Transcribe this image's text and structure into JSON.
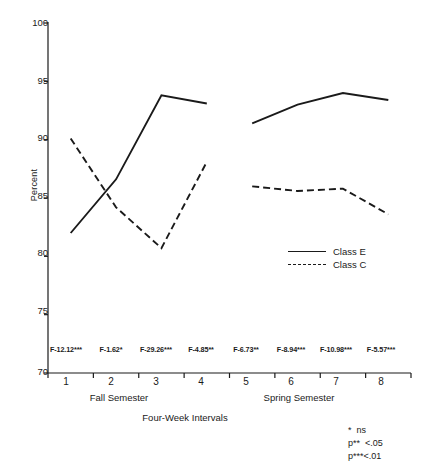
{
  "chart_data": {
    "type": "line",
    "title": "",
    "xlabel": "Four-Week Intervals",
    "ylabel": "Percent",
    "ylim": [
      70,
      100
    ],
    "ytick_labels": [
      "70",
      "75",
      "80",
      "85",
      "90",
      "95",
      "100"
    ],
    "yticks": [
      70,
      75,
      80,
      85,
      90,
      95,
      100
    ],
    "categories": [
      "1",
      "2",
      "3",
      "4",
      "5",
      "6",
      "7",
      "8"
    ],
    "x": [
      1,
      2,
      3,
      4,
      5,
      6,
      7,
      8
    ],
    "grid": false,
    "legend_position": "center-right",
    "series": [
      {
        "name": "Class E",
        "style": "solid",
        "values": [
          82.0,
          86.6,
          93.8,
          93.1,
          91.4,
          93.0,
          94.0,
          93.4
        ]
      },
      {
        "name": "Class C",
        "style": "dashed",
        "values": [
          90.1,
          84.2,
          80.7,
          88.1,
          86.0,
          85.6,
          85.8,
          83.6
        ]
      }
    ],
    "series_break_after_index": 3,
    "group_labels": [
      "Fall Semester",
      "Spring Semester"
    ],
    "annotations": [
      "F-12.12***",
      "F-1.62*",
      "F-29.26***",
      "F-4.85**",
      "F-6.73**",
      "F-8.94***",
      "F-10.98***",
      "F-5.57***"
    ],
    "footnotes": [
      "*  ns",
      "p**  <.05",
      "p***<.01"
    ],
    "line_color": "#1a1a1a",
    "axis_color": "#1a1a1a"
  }
}
